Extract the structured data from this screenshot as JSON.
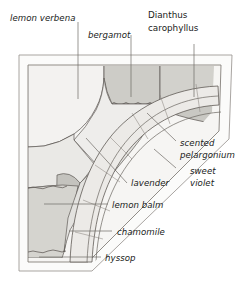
{
  "figure": {
    "type": "garden-planting-plan"
  },
  "labels": {
    "lemon_verbena": "lemon verbena",
    "bergamot": "bergamot",
    "dianthus_line1": "Dianthus",
    "dianthus_line2": "carophyllus",
    "scented_line1": "scented",
    "scented_line2": "pelargonium",
    "sweet_line1": "sweet",
    "sweet_line2": "violet",
    "lavender": "lavender",
    "lemon_balm": "lemon balm",
    "chamomile": "chamomile",
    "hyssop": "hyssop"
  },
  "colors": {
    "paper": "#ffffff",
    "ink": "#201c1a",
    "leader": "#6f6a66",
    "bed_edge": "#5f5a56",
    "frame": "#8d8883",
    "fill_pale": "#f2f1ef",
    "fill_light": "#e6e5e2",
    "fill_mid": "#d6d5d1",
    "fill_dark": "#c6c5c0",
    "fill_path": "#ecebe8"
  }
}
